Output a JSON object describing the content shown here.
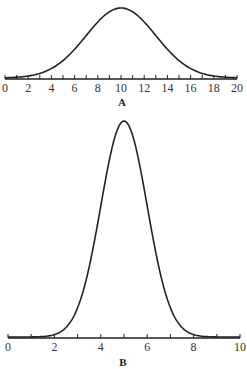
{
  "chart_data": [
    {
      "type": "line",
      "panel_label": "A",
      "title": "",
      "xlabel": "",
      "ylabel": "",
      "xlim": [
        0,
        20
      ],
      "x_ticks_major": [
        0,
        2,
        4,
        6,
        8,
        10,
        12,
        14,
        16,
        18,
        20
      ],
      "x_ticks_minor_step": 1,
      "grid": false,
      "series": [
        {
          "name": "normal curve A",
          "distribution": "normal",
          "mean": 10,
          "sd": 3
        }
      ],
      "color": "#222222"
    },
    {
      "type": "line",
      "panel_label": "B",
      "title": "",
      "xlabel": "",
      "ylabel": "",
      "xlim": [
        0,
        10
      ],
      "x_ticks_major": [
        0,
        2,
        4,
        6,
        8,
        10
      ],
      "x_ticks_minor_step": 1,
      "grid": false,
      "series": [
        {
          "name": "normal curve B",
          "distribution": "normal",
          "mean": 5,
          "sd": 1
        }
      ],
      "color": "#222222"
    }
  ],
  "panels": {
    "a": {
      "label": "A"
    },
    "b": {
      "label": "B"
    }
  }
}
